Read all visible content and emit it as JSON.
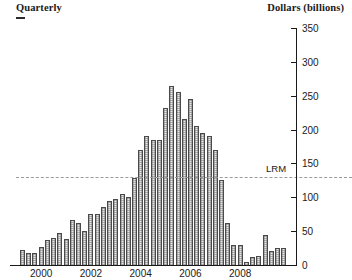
{
  "header": {
    "left_title": "Quarterly",
    "right_title": "Dollars (billions)"
  },
  "annotations": {
    "lrm_label": "LRM"
  },
  "chart_data": {
    "type": "bar",
    "title": "",
    "subtitle": "",
    "xlabel": "",
    "ylabel": "Dollars (billions)",
    "series_label": "Quarterly",
    "ylim": [
      0,
      350
    ],
    "yticks": [
      0,
      50,
      100,
      150,
      200,
      250,
      300,
      350
    ],
    "ytick_labels": [
      "0",
      "50",
      "100",
      "150",
      "200",
      "250",
      "300",
      "350"
    ],
    "xtick_labels": [
      "2000",
      "2002",
      "2004",
      "2006",
      "2008"
    ],
    "xtick_positions": [
      2000,
      2002,
      2004,
      2006,
      2008
    ],
    "grid": false,
    "legend_position": "none",
    "reference_lines": [
      {
        "label": "LRM",
        "value": 130,
        "style": "dashed",
        "color": "#9a9a9a"
      }
    ],
    "bar_color": "#e8e8e8",
    "bar_edge_color": "#4a4a4a",
    "x": [
      "1999Q2",
      "1999Q3",
      "1999Q4",
      "2000Q1",
      "2000Q2",
      "2000Q3",
      "2000Q4",
      "2001Q1",
      "2001Q2",
      "2001Q3",
      "2001Q4",
      "2002Q1",
      "2002Q2",
      "2002Q3",
      "2002Q4",
      "2003Q1",
      "2003Q2",
      "2003Q3",
      "2003Q4",
      "2004Q1",
      "2004Q2",
      "2004Q3",
      "2004Q4",
      "2005Q1",
      "2005Q2",
      "2005Q3",
      "2005Q4",
      "2006Q1",
      "2006Q2",
      "2006Q3",
      "2006Q4",
      "2007Q1",
      "2007Q2",
      "2007Q3",
      "2007Q4",
      "2008Q1",
      "2008Q2",
      "2008Q3",
      "2008Q4",
      "2009Q1",
      "2009Q2",
      "2009Q3",
      "2009Q4"
    ],
    "values": [
      22,
      18,
      18,
      26,
      37,
      40,
      48,
      38,
      67,
      62,
      50,
      75,
      75,
      85,
      95,
      97,
      105,
      100,
      128,
      170,
      190,
      185,
      185,
      232,
      265,
      255,
      215,
      245,
      205,
      195,
      190,
      170,
      125,
      62,
      30,
      30,
      4,
      12,
      14,
      45,
      20,
      25,
      25
    ]
  }
}
